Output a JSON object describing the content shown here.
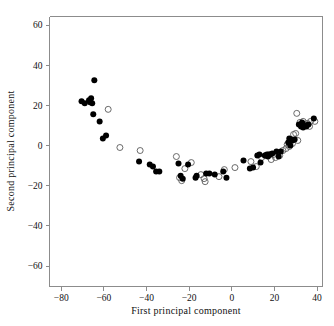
{
  "figure": {
    "background_color": "#ffffff",
    "frame_color": "#8c8c8c"
  },
  "chart_data": {
    "type": "scatter",
    "title": "",
    "subtitle": "",
    "xlabel": "First principal component",
    "ylabel": "Second principal component",
    "xlim": [
      -89,
      44
    ],
    "ylim": [
      -67,
      65
    ],
    "xticks": [
      -80,
      -60,
      -40,
      -20,
      0,
      20,
      40
    ],
    "xtick_labels": [
      "−80",
      "−60",
      "−40",
      "−20",
      "0",
      "20",
      "40"
    ],
    "yticks": [
      60,
      40,
      20,
      0,
      -20,
      -40,
      -60
    ],
    "ytick_labels": [
      "60",
      "40",
      "20",
      "0",
      "−20",
      "−40",
      "−60"
    ],
    "grid": false,
    "legend": null,
    "annotations": [],
    "series": [
      {
        "name": "filled-circles",
        "marker": "filled-circle",
        "color": "#000000",
        "marker_size": 3.0,
        "points": [
          [
            -70.5,
            22.0
          ],
          [
            -69.0,
            21.0
          ],
          [
            -67.0,
            22.5
          ],
          [
            -66.5,
            21.5
          ],
          [
            -66.0,
            23.5
          ],
          [
            -65.5,
            21.0
          ],
          [
            -64.5,
            32.5
          ],
          [
            -65.0,
            15.5
          ],
          [
            -62.0,
            12.0
          ],
          [
            -60.5,
            3.5
          ],
          [
            -59.0,
            5.0
          ],
          [
            -43.5,
            -8.0
          ],
          [
            -38.5,
            -9.5
          ],
          [
            -37.0,
            -10.5
          ],
          [
            -35.5,
            -13.0
          ],
          [
            -34.0,
            -13.0
          ],
          [
            -25.0,
            -9.0
          ],
          [
            -24.0,
            -15.0
          ],
          [
            -23.0,
            -16.5
          ],
          [
            -20.5,
            -9.5
          ],
          [
            -17.0,
            -16.0
          ],
          [
            -16.5,
            -15.0
          ],
          [
            -12.0,
            -14.0
          ],
          [
            -10.5,
            -14.0
          ],
          [
            -8.0,
            -14.5
          ],
          [
            -4.0,
            -13.0
          ],
          [
            -2.5,
            -16.0
          ],
          [
            5.5,
            -7.5
          ],
          [
            8.5,
            -11.5
          ],
          [
            10.0,
            -11.0
          ],
          [
            12.0,
            -5.0
          ],
          [
            13.0,
            -4.5
          ],
          [
            13.5,
            -8.5
          ],
          [
            15.5,
            -5.0
          ],
          [
            16.5,
            -4.5
          ],
          [
            17.0,
            -5.5
          ],
          [
            18.0,
            -4.5
          ],
          [
            19.0,
            -4.0
          ],
          [
            21.0,
            -3.0
          ],
          [
            22.0,
            -5.5
          ],
          [
            23.0,
            -3.0
          ],
          [
            26.5,
            1.5
          ],
          [
            27.0,
            3.5
          ],
          [
            27.5,
            0.0
          ],
          [
            28.0,
            3.0
          ],
          [
            28.5,
            2.5
          ],
          [
            29.5,
            3.0
          ],
          [
            31.5,
            10.5
          ],
          [
            32.5,
            9.5
          ],
          [
            33.0,
            11.5
          ],
          [
            33.5,
            9.0
          ],
          [
            34.5,
            10.0
          ],
          [
            35.0,
            9.5
          ],
          [
            36.0,
            10.5
          ],
          [
            38.5,
            13.5
          ]
        ]
      },
      {
        "name": "open-circles",
        "marker": "open-circle",
        "color": "#5a5a5a",
        "marker_size": 3.0,
        "points": [
          [
            -58.0,
            18.0
          ],
          [
            -52.5,
            -1.0
          ],
          [
            -43.0,
            -2.5
          ],
          [
            -26.0,
            -5.5
          ],
          [
            -24.5,
            -16.0
          ],
          [
            -23.5,
            -17.5
          ],
          [
            -22.0,
            -11.5
          ],
          [
            -19.0,
            -8.5
          ],
          [
            -14.5,
            -14.5
          ],
          [
            -13.0,
            -16.5
          ],
          [
            -12.5,
            -18.0
          ],
          [
            -6.0,
            -15.5
          ],
          [
            -3.5,
            -12.0
          ],
          [
            1.5,
            -11.0
          ],
          [
            9.0,
            -8.0
          ],
          [
            11.5,
            -10.5
          ],
          [
            14.0,
            -6.0
          ],
          [
            16.0,
            -5.0
          ],
          [
            17.5,
            -4.5
          ],
          [
            18.5,
            -7.0
          ],
          [
            19.5,
            -4.5
          ],
          [
            20.5,
            -6.0
          ],
          [
            22.5,
            -5.0
          ],
          [
            24.0,
            -2.5
          ],
          [
            25.5,
            -1.5
          ],
          [
            26.0,
            0.5
          ],
          [
            27.0,
            -0.5
          ],
          [
            28.5,
            1.0
          ],
          [
            29.0,
            5.5
          ],
          [
            30.0,
            6.0
          ],
          [
            30.5,
            16.0
          ],
          [
            31.0,
            2.5
          ],
          [
            32.0,
            11.5
          ],
          [
            33.5,
            12.0
          ],
          [
            34.0,
            10.5
          ],
          [
            35.5,
            11.0
          ],
          [
            36.5,
            9.5
          ],
          [
            37.0,
            12.0
          ],
          [
            39.0,
            12.0
          ]
        ]
      }
    ]
  }
}
